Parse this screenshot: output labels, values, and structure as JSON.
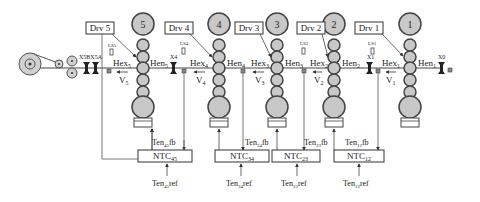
{
  "diagram": {
    "title": "",
    "stands": [
      {
        "id": "5",
        "x": 121,
        "drive": "Drv 5",
        "hex": "Hex",
        "hex_sub": "5",
        "hen": "Hen",
        "hen_sub": "5",
        "v": "V",
        "v_sub": "5",
        "ls": "LS5"
      },
      {
        "id": "4",
        "x": 245,
        "drive": "Drv 4",
        "hex": "Hex",
        "hex_sub": "4",
        "hen": "Hen",
        "hen_sub": "4",
        "v": "V",
        "v_sub": "4",
        "ls": "LS4"
      },
      {
        "id": "3",
        "x": 304,
        "drive": "Drv 3",
        "hex": "Hex",
        "hex_sub": "3",
        "hen": "Hen",
        "hen_sub": "3",
        "v": "V",
        "v_sub": "3",
        "ls": "LS2"
      },
      {
        "id": "2",
        "x": 334,
        "drive": "Drv 2",
        "hex": "Hex",
        "hex_sub": "2",
        "hen": "Hen",
        "hen_sub": "2",
        "v": "V",
        "v_sub": "2",
        "ls": "LS1"
      },
      {
        "id": "1",
        "x": 410,
        "drive": "Drv 1",
        "hex": "Hex",
        "hex_sub": "1",
        "hen": "Hen",
        "hen_sub": "1",
        "v": "V",
        "v_sub": "1",
        "ls": ""
      }
    ],
    "labels": {
      "drv5": "Drv 5",
      "drv4": "Drv 4",
      "drv3": "Drv 3",
      "drv2": "Drv 2",
      "drv1": "Drv 1",
      "roll5": "5",
      "roll4": "4",
      "roll3": "3",
      "roll2": "2",
      "roll1": "1",
      "ls5": "LS5",
      "ls4": "LS4",
      "ls2": "LS2",
      "ls1": "LS1",
      "x5bx5a": "X5BX5A",
      "x4": "X4",
      "x1": "X1",
      "x0": "X0",
      "hex": "Hex",
      "hen": "Hen",
      "v": "V",
      "s5": "5",
      "s4": "4",
      "s3": "3",
      "s2": "2",
      "s1": "1"
    },
    "controllers": [
      {
        "name": "NTC",
        "sub": "45",
        "fb": "Ten",
        "fb_sub": "45",
        "fb_suffix": "fb",
        "ref": "Ten",
        "ref_sub": "45",
        "ref_suffix": "ref"
      },
      {
        "name": "NTC",
        "sub": "34",
        "fb": "Ten",
        "fb_sub": "34",
        "fb_suffix": "fb",
        "ref": "Ten",
        "ref_sub": "34",
        "ref_suffix": "ref"
      },
      {
        "name": "NTC",
        "sub": "23",
        "fb": "Ten",
        "fb_sub": "23",
        "fb_suffix": "fb",
        "ref": "Ten",
        "ref_sub": "23",
        "ref_suffix": "ref"
      },
      {
        "name": "NTC",
        "sub": "12",
        "fb": "Ten",
        "fb_sub": "12",
        "fb_suffix": "fb",
        "ref": "Ten",
        "ref_sub": "12",
        "ref_suffix": "ref"
      }
    ],
    "colors": {
      "roll_fill": "#c8c8c8",
      "roll_stroke": "#444444",
      "line": "#555555",
      "text": "#222222"
    }
  }
}
